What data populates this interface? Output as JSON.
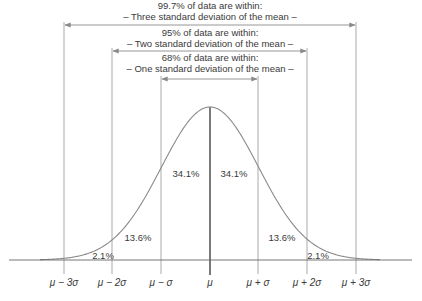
{
  "chart_data": {
    "type": "area",
    "distribution": {
      "mean_label": "μ",
      "sigma_label": "σ"
    },
    "x_ticks": [
      "μ − 3σ",
      "μ − 2σ",
      "μ − σ",
      "μ",
      "μ + σ",
      "μ + 2σ",
      "μ + 3σ"
    ],
    "x_tick_positions_sigma": [
      -3,
      -2,
      -1,
      0,
      1,
      2,
      3
    ],
    "regions": [
      {
        "from": -3,
        "to": -2,
        "percent": "2.1%"
      },
      {
        "from": -2,
        "to": -1,
        "percent": "13.6%"
      },
      {
        "from": -1,
        "to": 0,
        "percent": "34.1%"
      },
      {
        "from": 0,
        "to": 1,
        "percent": "34.1%"
      },
      {
        "from": 1,
        "to": 2,
        "percent": "13.6%"
      },
      {
        "from": 2,
        "to": 3,
        "percent": "2.1%"
      }
    ],
    "ranges": [
      {
        "sigma": 3,
        "line1": "99.7% of data are within:",
        "line2": "– Three standard deviation of the mean –"
      },
      {
        "sigma": 2,
        "line1": "95% of data are within:",
        "line2": "– Two standard deviation of the mean –"
      },
      {
        "sigma": 1,
        "line1": "68% of data are within:",
        "line2": "– One standard deviation of the mean –"
      }
    ],
    "grid": false,
    "legend": null
  },
  "labels": {
    "range3_line1": "99.7% of data are within:",
    "range3_line2": "– Three standard deviation of the mean –",
    "range2_line1": "95% of data are within:",
    "range2_line2": "– Two standard deviation of the mean –",
    "range1_line1": "68% of data are within:",
    "range1_line2": "– One standard deviation of the mean –",
    "pct_l3": "2.1%",
    "pct_l2": "13.6%",
    "pct_l1": "34.1%",
    "pct_r1": "34.1%",
    "pct_r2": "13.6%",
    "pct_r3": "2.1%",
    "tick_m3": "μ − 3σ",
    "tick_m2": "μ − 2σ",
    "tick_m1": "μ − σ",
    "tick_0": "μ",
    "tick_p1": "μ + σ",
    "tick_p2": "μ + 2σ",
    "tick_p3": "μ + 3σ"
  },
  "colors": {
    "curve": "#8a8a8a",
    "lines": "#9a9a9a",
    "center_line": "#333333",
    "text": "#3a3a3a"
  }
}
